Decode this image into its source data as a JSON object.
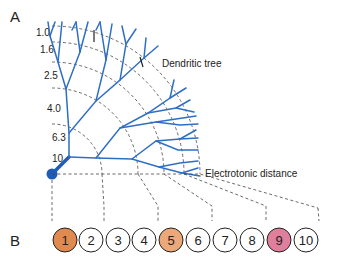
{
  "panels": {
    "a": {
      "label": "A"
    },
    "b": {
      "label": "B"
    }
  },
  "labels": {
    "dendritic_tree": "Dendritic tree",
    "electrotonic_distance": "Electrotonic distance"
  },
  "distance_ticks": [
    "1.0",
    "1.6",
    "2.5",
    "4.0",
    "6.3",
    "10"
  ],
  "compartments": [
    {
      "n": "1",
      "color": "#e08a4f"
    },
    {
      "n": "2",
      "color": "#ffffff"
    },
    {
      "n": "3",
      "color": "#ffffff"
    },
    {
      "n": "4",
      "color": "#ffffff"
    },
    {
      "n": "5",
      "color": "#eba878"
    },
    {
      "n": "6",
      "color": "#ffffff"
    },
    {
      "n": "7",
      "color": "#ffffff"
    },
    {
      "n": "8",
      "color": "#ffffff"
    },
    {
      "n": "9",
      "color": "#e07f9c"
    },
    {
      "n": "10",
      "color": "#ffffff"
    }
  ],
  "colors": {
    "dendrite": "#2f6ec5",
    "soma": "#1f5cb8"
  }
}
